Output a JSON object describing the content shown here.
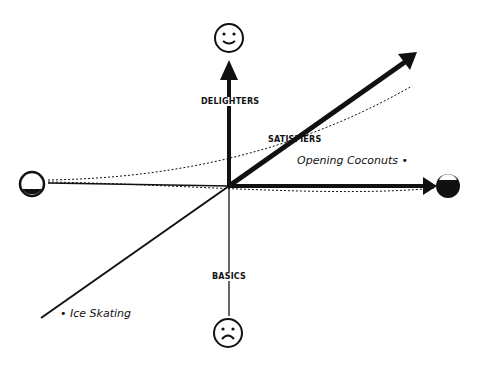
{
  "diagram": {
    "type": "Kano model",
    "categories": {
      "delighters": "DELIGHTERS",
      "satisfiers": "SATISFIERS",
      "basics": "BASICS"
    },
    "items": [
      {
        "label": "Opening Coconuts •",
        "position": "right, just above horizontal axis"
      },
      {
        "label": "• Ice Skating",
        "position": "bottom-left, end of satisfiers line"
      }
    ],
    "icons": {
      "top": "happy-face-icon",
      "bottom": "sad-face-icon",
      "left": "empty-circle-icon",
      "right": "filled-circle-icon"
    },
    "colors": {
      "ink": "#111111",
      "background": "#ffffff"
    }
  }
}
